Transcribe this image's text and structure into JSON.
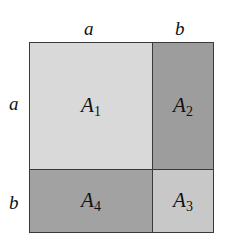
{
  "diagram": {
    "top_labels": [
      "a",
      "b"
    ],
    "side_labels": [
      "a",
      "b"
    ],
    "regions": [
      {
        "id": "A1",
        "letter": "A",
        "sub": "1",
        "fill": "#d9d9d9"
      },
      {
        "id": "A2",
        "letter": "A",
        "sub": "2",
        "fill": "#9d9d9d"
      },
      {
        "id": "A3",
        "letter": "A",
        "sub": "3",
        "fill": "#c8c8c8"
      },
      {
        "id": "A4",
        "letter": "A",
        "sub": "4",
        "fill": "#a2a2a2"
      }
    ]
  }
}
